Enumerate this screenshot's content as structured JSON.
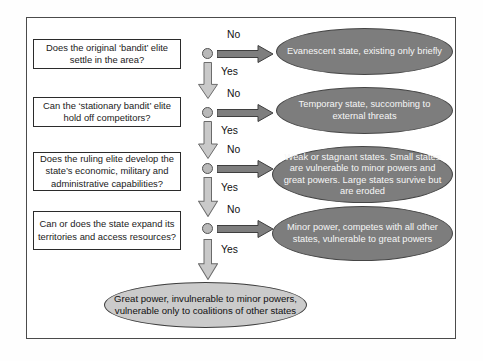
{
  "figure": {
    "type": "decision-flowchart",
    "rows": [
      {
        "question": "Does the original ‘bandit’ elite settle in the area?",
        "no": "No",
        "yes": "Yes",
        "outcome": "Evanescent state, existing only briefly"
      },
      {
        "question": "Can the ‘stationary bandit’ elite hold off competitors?",
        "no": "No",
        "yes": "Yes",
        "outcome": "Temporary state, succombing to external threats"
      },
      {
        "question": "Does the ruling elite develop the state’s economic, military and administrative capabilities?",
        "no": "No",
        "yes": "Yes",
        "outcome": "Weak or stagnant states. Small states are vulnerable to minor powers and great powers. Large states survive but are eroded"
      },
      {
        "question": "Can or does the state expand its territories and access resources?",
        "no": "No",
        "yes": "Yes",
        "outcome": "Minor power, competes with all other states, vulnerable to great powers"
      }
    ],
    "final_outcome": "Great power, invulnerable to minor powers, vulnerable only to coalitions of other states",
    "colors": {
      "outcome_oval_fill": "#7d7d7d",
      "outcome_oval_text": "#f6f6f6",
      "final_oval_fill": "#cbcbcb",
      "no_arrow_fill": "#7e7e7e",
      "yes_arrow_fill": "#c9c9c9",
      "node_fill": "#b9b9b9",
      "outline": "#3f3f3f"
    }
  }
}
